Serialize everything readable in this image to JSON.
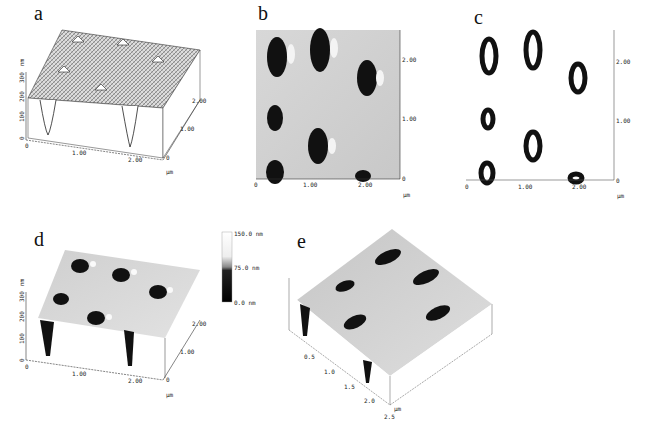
{
  "figure": {
    "panels": [
      {
        "id": "a",
        "label": "a",
        "type": "3d-surface-contour",
        "z_ticks": [
          "0",
          "100",
          "200",
          "300"
        ],
        "z_unit": "nm",
        "x_ticks": [
          "0",
          "1.00",
          "2.00"
        ],
        "y_ticks": [
          "0",
          "1.00",
          "2.00"
        ],
        "unit": "µm"
      },
      {
        "id": "b",
        "label": "b",
        "type": "2d-height-map",
        "x_ticks": [
          "0",
          "1.00",
          "2.00"
        ],
        "y_ticks": [
          "0",
          "1.00",
          "2.00"
        ],
        "unit": "µm"
      },
      {
        "id": "c",
        "label": "c",
        "type": "2d-contour-map",
        "x_ticks": [
          "0",
          "1.00",
          "2.00"
        ],
        "y_ticks": [
          "0",
          "1.00",
          "2.00"
        ],
        "unit": "µm"
      },
      {
        "id": "d",
        "label": "d",
        "type": "3d-surface-shaded",
        "z_ticks": [
          "0",
          "100",
          "200",
          "300"
        ],
        "z_unit": "nm",
        "x_ticks": [
          "0",
          "1.00",
          "2.00"
        ],
        "y_ticks": [
          "0",
          "1.00",
          "2.00"
        ],
        "unit": "µm",
        "colorbar": {
          "max": "150.0 nm",
          "mid": "75.0 nm",
          "min": "0.0 nm"
        }
      },
      {
        "id": "e",
        "label": "e",
        "type": "3d-surface-shaded",
        "x_ticks": [
          "0.5",
          "1.0",
          "1.5",
          "2.0",
          "2.5"
        ],
        "unit": "µm"
      }
    ]
  }
}
